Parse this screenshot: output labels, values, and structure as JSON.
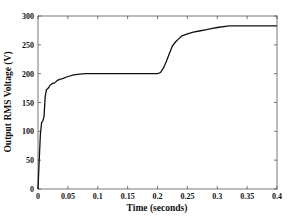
{
  "chart_data": {
    "type": "line",
    "title": "",
    "xlabel": "Time (seconds)",
    "ylabel": "Output RMS Voltage (V)",
    "xlim": [
      0,
      0.4
    ],
    "ylim": [
      0,
      300
    ],
    "xticks": [
      0,
      0.05,
      0.1,
      0.15,
      0.2,
      0.25,
      0.3,
      0.35,
      0.4
    ],
    "xtick_labels": [
      "0",
      "0.05",
      "0.1",
      "0.15",
      "0.2",
      "0.25",
      "0.3",
      "0.35",
      "0.4"
    ],
    "yticks": [
      0,
      50,
      100,
      150,
      200,
      250,
      300
    ],
    "ytick_labels": [
      "0",
      "50",
      "100",
      "150",
      "200",
      "250",
      "300"
    ],
    "grid": false,
    "legend": null,
    "series": [
      {
        "name": "Output RMS Voltage",
        "color": "#111111",
        "x": [
          0,
          0.002,
          0.004,
          0.006,
          0.008,
          0.01,
          0.012,
          0.014,
          0.016,
          0.018,
          0.02,
          0.024,
          0.028,
          0.032,
          0.036,
          0.04,
          0.05,
          0.06,
          0.07,
          0.08,
          0.1,
          0.15,
          0.2,
          0.205,
          0.21,
          0.215,
          0.22,
          0.225,
          0.23,
          0.235,
          0.24,
          0.25,
          0.26,
          0.27,
          0.28,
          0.29,
          0.3,
          0.32,
          0.34,
          0.36,
          0.38,
          0.4
        ],
        "values": [
          0,
          50,
          95,
          115,
          118,
          125,
          160,
          172,
          174,
          176,
          180,
          183,
          184,
          188,
          190,
          191,
          195,
          198,
          199,
          200,
          200,
          200,
          200,
          202,
          210,
          222,
          235,
          248,
          255,
          260,
          265,
          269,
          272,
          274,
          276,
          278,
          280,
          283,
          283,
          283,
          283,
          283
        ]
      }
    ]
  }
}
